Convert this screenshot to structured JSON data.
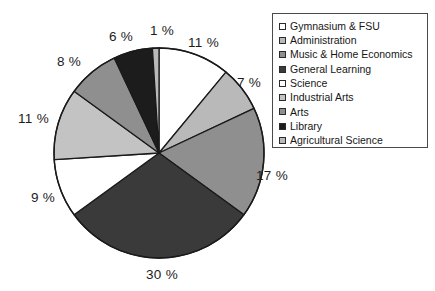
{
  "chart_data": {
    "type": "pie",
    "title": "",
    "legend_position": "right",
    "labels": [
      "Gymnasium & FSU",
      "Administration",
      "Music & Home Economics",
      "General Learning",
      "Science",
      "Industrial  Arts",
      "Arts",
      "Library",
      "Agricultural  Science"
    ],
    "values": [
      11,
      7,
      17,
      30,
      9,
      11,
      8,
      6,
      1
    ],
    "value_labels": [
      "11 %",
      "7 %",
      "17 %",
      "30 %",
      "9 %",
      "11 %",
      "8 %",
      "6 %",
      "1 %"
    ],
    "colors": [
      "#ffffff",
      "#b9b9b9",
      "#8f8f8f",
      "#3a3a3a",
      "#ffffff",
      "#c3c3c3",
      "#8f8f8f",
      "#1c1c1c",
      "#b9b9b9"
    ],
    "unit": "%",
    "start_angle_deg": 0,
    "direction": "clockwise",
    "outline_color": "#1a1a1a"
  },
  "legend": {
    "items": [
      {
        "label": "Gymnasium & FSU",
        "color": "#ffffff"
      },
      {
        "label": "Administration",
        "color": "#b9b9b9"
      },
      {
        "label": "Music & Home Economics",
        "color": "#8f8f8f"
      },
      {
        "label": "General Learning",
        "color": "#3a3a3a"
      },
      {
        "label": "Science",
        "color": "#ffffff"
      },
      {
        "label": "Industrial  Arts",
        "color": "#c3c3c3"
      },
      {
        "label": "Arts",
        "color": "#8f8f8f"
      },
      {
        "label": "Library",
        "color": "#1c1c1c"
      },
      {
        "label": "Agricultural  Science",
        "color": "#b9b9b9"
      }
    ]
  },
  "pct_labels": [
    {
      "text": "11 %",
      "x": 188,
      "y": 36
    },
    {
      "text": "7 %",
      "x": 237,
      "y": 76
    },
    {
      "text": "17 %",
      "x": 256,
      "y": 169
    },
    {
      "text": "30 %",
      "x": 146,
      "y": 268
    },
    {
      "text": "9 %",
      "x": 31,
      "y": 191
    },
    {
      "text": "11 %",
      "x": 18,
      "y": 112
    },
    {
      "text": "8 %",
      "x": 57,
      "y": 55
    },
    {
      "text": "6 %",
      "x": 109,
      "y": 30
    },
    {
      "text": "1 %",
      "x": 150,
      "y": 24
    }
  ]
}
